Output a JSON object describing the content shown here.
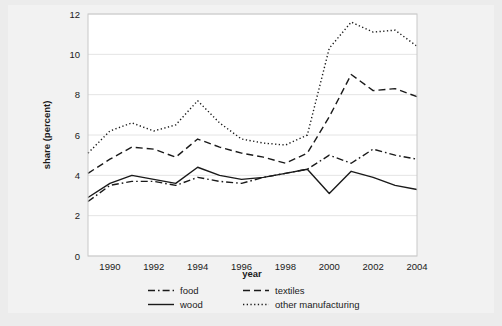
{
  "chart_data": {
    "type": "line",
    "title": "",
    "xlabel": "year",
    "ylabel": "share (percent)",
    "xlim": [
      1989,
      2004
    ],
    "ylim": [
      0,
      12
    ],
    "grid": true,
    "grid_axis": "y",
    "legend_position": "bottom",
    "x": [
      1989,
      1990,
      1991,
      1992,
      1993,
      1994,
      1995,
      1996,
      1997,
      1998,
      1999,
      2000,
      2001,
      2002,
      2003,
      2004
    ],
    "xticks": [
      1990,
      1992,
      1994,
      1996,
      1998,
      2000,
      2002,
      2004
    ],
    "xtick_labels": [
      "1990",
      "1992",
      "1994",
      "1996",
      "1998",
      "2000",
      "2002",
      "2004"
    ],
    "yticks": [
      0,
      2,
      4,
      6,
      8,
      10,
      12
    ],
    "ytick_labels": [
      "0",
      "2",
      "4",
      "6",
      "8",
      "10",
      "12"
    ],
    "series": [
      {
        "name": "food",
        "style": "dashdot",
        "color": "#1a1a1a",
        "values": [
          2.7,
          3.5,
          3.7,
          3.7,
          3.5,
          3.9,
          3.7,
          3.6,
          3.9,
          4.1,
          4.3,
          5.0,
          4.6,
          5.3,
          5.0,
          4.8
        ]
      },
      {
        "name": "textiles",
        "style": "dashed",
        "color": "#1a1a1a",
        "values": [
          4.1,
          4.8,
          5.4,
          5.3,
          4.9,
          5.8,
          5.4,
          5.1,
          4.9,
          4.6,
          5.1,
          6.9,
          9.0,
          8.2,
          8.3,
          7.9
        ]
      },
      {
        "name": "wood",
        "style": "solid",
        "color": "#1a1a1a",
        "values": [
          2.9,
          3.6,
          4.0,
          3.8,
          3.6,
          4.4,
          4.0,
          3.8,
          3.9,
          4.1,
          4.3,
          3.1,
          4.2,
          3.9,
          3.5,
          3.3
        ]
      },
      {
        "name": "other manufacturing",
        "style": "dotted",
        "color": "#1a1a1a",
        "values": [
          5.1,
          6.2,
          6.6,
          6.2,
          6.5,
          7.7,
          6.6,
          5.8,
          5.6,
          5.5,
          6.0,
          10.3,
          11.6,
          11.1,
          11.2,
          10.4
        ]
      }
    ]
  },
  "axes": {
    "x_title": "year",
    "y_title": "share (percent)"
  },
  "legend": {
    "entries": [
      {
        "label": "food",
        "style": "dashdot"
      },
      {
        "label": "textiles",
        "style": "dashed"
      },
      {
        "label": "wood",
        "style": "solid"
      },
      {
        "label": "other manufacturing",
        "style": "dotted"
      }
    ]
  },
  "colors": {
    "figure_background": "#ececec",
    "inner_background": "#f2f2f2",
    "plot_background": "#ffffff",
    "line": "#1a1a1a",
    "grid": "#e4e4e4",
    "frame": "#bfbfbf",
    "text": "#1a1a1a"
  }
}
